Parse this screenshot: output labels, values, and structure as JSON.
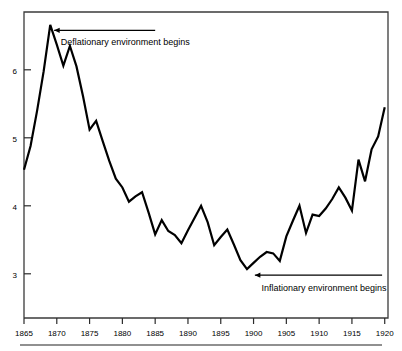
{
  "chart_data": {
    "type": "line",
    "title": "",
    "subtitle": "",
    "xlabel": "",
    "ylabel": "",
    "xlim": [
      1865,
      1920.5
    ],
    "ylim": [
      2.35,
      6.85
    ],
    "grid": false,
    "legend": null,
    "xticks": [
      1865,
      1870,
      1875,
      1880,
      1885,
      1890,
      1895,
      1900,
      1905,
      1910,
      1915,
      1920
    ],
    "xtick_labels": [
      "1865",
      "1870",
      "1875",
      "1880",
      "1885",
      "1890",
      "1895",
      "1900",
      "1905",
      "1910",
      "1915",
      "1920"
    ],
    "yticks": [
      3,
      4,
      5,
      6
    ],
    "ytick_labels": [
      "3",
      "4",
      "5",
      "6"
    ],
    "x": [
      1865,
      1866,
      1867,
      1868,
      1869,
      1870,
      1871,
      1872,
      1873,
      1874,
      1875,
      1876,
      1877,
      1878,
      1879,
      1880,
      1881,
      1882,
      1883,
      1884,
      1885,
      1886,
      1887,
      1888,
      1889,
      1890,
      1891,
      1892,
      1893,
      1894,
      1895,
      1896,
      1897,
      1898,
      1899,
      1900,
      1901,
      1902,
      1903,
      1904,
      1905,
      1906,
      1907,
      1908,
      1909,
      1910,
      1911,
      1912,
      1913,
      1914,
      1915,
      1916,
      1917,
      1918,
      1919,
      1920
    ],
    "y": [
      4.53,
      4.88,
      5.4,
      5.98,
      6.66,
      6.37,
      6.06,
      6.35,
      6.05,
      5.61,
      5.12,
      5.25,
      4.95,
      4.66,
      4.4,
      4.27,
      4.06,
      4.14,
      4.2,
      3.9,
      3.58,
      3.79,
      3.63,
      3.57,
      3.45,
      3.64,
      3.82,
      4.0,
      3.76,
      3.42,
      3.54,
      3.65,
      3.43,
      3.2,
      3.07,
      3.16,
      3.25,
      3.32,
      3.3,
      3.19,
      3.55,
      3.78,
      4.0,
      3.6,
      3.87,
      3.85,
      3.96,
      4.1,
      4.27,
      4.12,
      3.93,
      4.68,
      4.36,
      4.83,
      5.02,
      5.45
    ],
    "series": [
      {
        "name": "value",
        "values": [
          4.53,
          4.88,
          5.4,
          5.98,
          6.66,
          6.37,
          6.06,
          6.35,
          6.05,
          5.61,
          5.12,
          5.25,
          4.95,
          4.66,
          4.4,
          4.27,
          4.06,
          4.14,
          4.2,
          3.9,
          3.58,
          3.79,
          3.63,
          3.57,
          3.45,
          3.64,
          3.82,
          4.0,
          3.76,
          3.42,
          3.54,
          3.65,
          3.43,
          3.2,
          3.07,
          3.16,
          3.25,
          3.32,
          3.3,
          3.19,
          3.55,
          3.78,
          4.0,
          3.6,
          3.87,
          3.85,
          3.96,
          4.1,
          4.27,
          4.12,
          3.93,
          4.68,
          4.36,
          4.83,
          5.02,
          5.45
        ],
        "color": "#000000"
      }
    ],
    "annotations": [
      {
        "id": "deflationary",
        "text": "Deflationary environment begins",
        "arrow": "left-arrow",
        "arrow_from_x": 1885.0,
        "arrow_to_x": 1869.6,
        "arrow_y": 6.58,
        "text_x": 1870.6,
        "text_y": 6.36
      },
      {
        "id": "inflationary",
        "text": "Inflationary environment begins",
        "arrow": "left-arrow",
        "arrow_from_x": 1919.6,
        "arrow_to_x": 1900.2,
        "arrow_y": 2.98,
        "text_x": 1901.2,
        "text_y": 2.74
      }
    ],
    "line_color": "#000000",
    "frame_color": "#3b3b3b",
    "background": "#ffffff"
  }
}
